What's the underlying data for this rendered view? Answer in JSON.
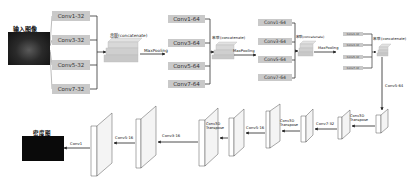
{
  "input": {
    "label": "输入图像"
  },
  "output": {
    "label": "密度图"
  },
  "encoder": {
    "stage1": {
      "convs": [
        "Conv1-32",
        "Conv3-32",
        "Conv5-32",
        "Conv7-32"
      ],
      "concat": "串联(concatenate)",
      "pool": "MaxPooling"
    },
    "stage2": {
      "convs": [
        "Conv1-64",
        "Conv3-64",
        "Conv5-64",
        "Conv7-64"
      ],
      "concat": "串联(concatenate)",
      "pool": "MaxPooling"
    },
    "stage3": {
      "convs": [
        "Conv1-64",
        "Conv3-64",
        "Conv5-64",
        "Conv7-64"
      ],
      "concat": "串联(concatenate)",
      "pool": "MaxPooling"
    },
    "stage4": {
      "convs": [
        "Conv1-32",
        "Conv3-32",
        "Conv5-32",
        "Conv7-32"
      ],
      "concat": "串联(concatenate)"
    }
  },
  "bridge": {
    "label": "Conv5-64"
  },
  "decoder": {
    "labels": [
      "Conv3D Transpose",
      "Conv7-32",
      "Conv3D Transpose",
      "Conv5-16",
      "Conv3D Transpose",
      "Conv3-16",
      "Conv5-16",
      "Conv1"
    ]
  },
  "colors": {
    "conv_box": "#c9c9c9",
    "concat_block": "#d4d4d4",
    "line": "#333333"
  }
}
